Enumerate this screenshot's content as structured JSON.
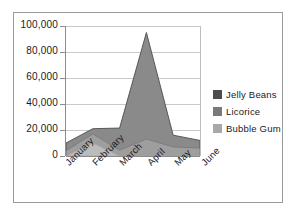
{
  "chart_data": {
    "type": "area",
    "stacked": true,
    "title": "",
    "xlabel": "",
    "ylabel": "",
    "categories": [
      "January",
      "February",
      "March",
      "April",
      "May",
      "June"
    ],
    "ylim": [
      0,
      100000
    ],
    "yticks": [
      0,
      20000,
      40000,
      60000,
      80000,
      100000
    ],
    "ytick_labels": [
      "0",
      "20,000",
      "40,000",
      "60,000",
      "80,000",
      "100,000"
    ],
    "grid": true,
    "legend_position": "right",
    "series": [
      {
        "name": "Jelly Beans",
        "color": "#4d4d4d",
        "area_color": "#8a8a8a",
        "values": [
          6000,
          4000,
          17000,
          82000,
          9000,
          6000
        ]
      },
      {
        "name": "Licorice",
        "color": "#7a7a7a",
        "area_color": "#9e9e9e",
        "values": [
          4000,
          7000,
          4500,
          13000,
          7000,
          6000
        ]
      },
      {
        "name": "Bubble Gum",
        "color": "#a8a8a8",
        "area_color": "#bcbcbc",
        "values": [
          0,
          10000,
          0,
          0,
          0,
          0
        ]
      }
    ],
    "totals": [
      10000,
      11000,
      21500,
      95000,
      16000,
      12000
    ]
  },
  "colors": {
    "frame_border": "#9a9a9a",
    "gridline": "#c9c9c9",
    "axis": "#8c8c8c",
    "text": "#1a1a1a",
    "background": "#ffffff"
  }
}
